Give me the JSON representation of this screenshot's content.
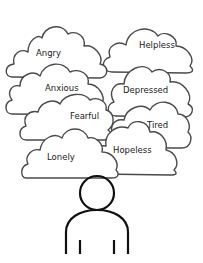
{
  "diagram": {
    "type": "emotion-clouds-over-person",
    "colors": {
      "background": "#ffffff",
      "cloud_stroke": "#4a4a4a",
      "cloud_fill": "#ffffff",
      "person_stroke": "#111111",
      "text": "#222222"
    },
    "clouds": [
      {
        "label": "Angry"
      },
      {
        "label": "Helpless"
      },
      {
        "label": "Anxious"
      },
      {
        "label": "Depressed"
      },
      {
        "label": "Fearful"
      },
      {
        "label": "Tired"
      },
      {
        "label": "Hopeless"
      },
      {
        "label": "Lonely"
      }
    ],
    "figure": "person-outline-icon"
  }
}
